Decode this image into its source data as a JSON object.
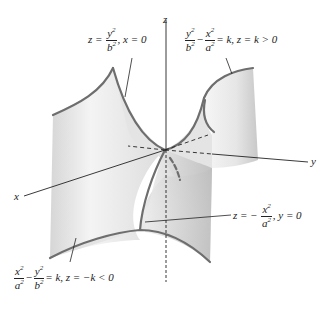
{
  "figure": {
    "axes": {
      "x": "x",
      "y": "y",
      "z": "z"
    },
    "labels": {
      "trace_x0": {
        "lhs": "z =",
        "num": "y",
        "den": "b",
        "exp": "2",
        "rest": ", x = 0"
      },
      "trace_zk_pos": {
        "num1": "y",
        "den1": "b",
        "minus": "−",
        "num2": "x",
        "den2": "a",
        "exp": "2",
        "rest": "= k, z = k > 0"
      },
      "trace_y0": {
        "lhs": "z = −",
        "num": "x",
        "den": "a",
        "exp": "2",
        "rest": ", y = 0"
      },
      "trace_zk_neg": {
        "num1": "x",
        "den1": "a",
        "minus": "−",
        "num2": "y",
        "den2": "b",
        "exp": "2",
        "rest": "= k, z = −k < 0"
      }
    },
    "colors": {
      "surface_light": "#f2f2f2",
      "surface_mid": "#d9d9d9",
      "surface_dark": "#bdbdbd",
      "trace_line": "#6e6e6e",
      "axis_line": "#222222"
    }
  }
}
